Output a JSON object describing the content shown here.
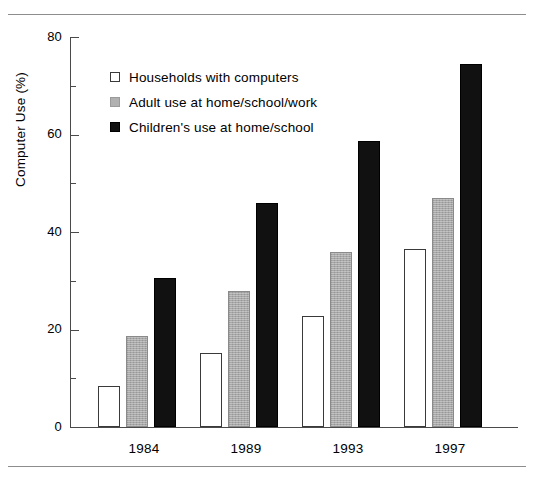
{
  "chart_data": {
    "type": "bar",
    "title": "",
    "subtitle": "",
    "xlabel": "",
    "ylabel": "Computer Use (%)",
    "categories": [
      "1984",
      "1989",
      "1993",
      "1997"
    ],
    "series": [
      {
        "name": "Households with computers",
        "swatch": "white",
        "color": "#ffffff",
        "values": [
          8.5,
          15.2,
          22.8,
          36.6
        ]
      },
      {
        "name": "Adult use at home/school/work",
        "swatch": "gray",
        "color": "#a8a8a8",
        "values": [
          18.7,
          28.0,
          36.0,
          47.0
        ]
      },
      {
        "name": "Children's use at home/school",
        "swatch": "black",
        "color": "#111111",
        "values": [
          30.5,
          46.0,
          58.6,
          74.5
        ]
      }
    ],
    "ylim": [
      0,
      80
    ],
    "y_major_ticks": [
      0,
      20,
      40,
      60,
      80
    ],
    "y_minor_ticks": [
      10,
      30,
      50,
      70
    ],
    "y_tick_labels": [
      "0",
      "20",
      "40",
      "60",
      "80"
    ],
    "grid": false,
    "legend_position": "upper left inside"
  },
  "axis": {
    "y_labels": [
      "80",
      "60",
      "40",
      "20",
      "0"
    ],
    "y_title": "Computer Use (%)",
    "x_labels": [
      "1984",
      "1989",
      "1993",
      "1997"
    ]
  },
  "legend": {
    "entries": [
      {
        "label": "Households with computers"
      },
      {
        "label": "Adult use at home/school/work"
      },
      {
        "label": "Children's use at home/school"
      }
    ]
  }
}
